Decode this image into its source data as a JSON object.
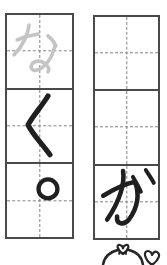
{
  "sheet": {
    "type": "kana-handwriting-practice-grid",
    "left_column": {
      "cells": [
        {
          "char": "な",
          "style": "trace-guide"
        },
        {
          "char": "く",
          "style": "ink"
        },
        {
          "char": "。",
          "style": "ink"
        }
      ]
    },
    "right_column": {
      "cells": [
        {
          "char": "",
          "style": "empty"
        },
        {
          "char": "",
          "style": "empty"
        },
        {
          "char": "が",
          "style": "ink"
        }
      ]
    },
    "colors": {
      "cell_border": "#4a4a4a",
      "center_guides": "#848484",
      "trace_character": "#c4c4c4",
      "ink_character": "#1f1f1f"
    }
  },
  "illustration": {
    "name": "drawstring-pouch-with-hearts",
    "visibility": "partially cut off at bottom edge",
    "outline_color": "#262626"
  }
}
